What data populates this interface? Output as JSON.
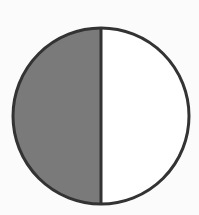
{
  "figure": {
    "type": "fraction-circle",
    "total_parts": 2,
    "shaded_parts": 1,
    "fraction_shaded": "1/2",
    "shaded_side": "left",
    "colors": {
      "background": "#fbfbfb",
      "shaded_fill": "#7a7a7a",
      "unshaded_fill": "#ffffff",
      "outline": "#333333"
    },
    "geometry": {
      "cx": 101,
      "cy": 116,
      "r": 88,
      "stroke_width": 3
    }
  },
  "chart_data": {
    "type": "pie",
    "title": "",
    "categories": [
      "shaded",
      "unshaded"
    ],
    "values": [
      50,
      50
    ],
    "colors": [
      "#7a7a7a",
      "#ffffff"
    ],
    "legend": "none"
  }
}
